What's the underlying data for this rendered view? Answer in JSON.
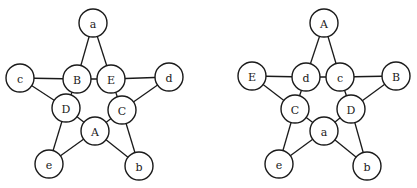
{
  "node_radius": 14,
  "colors": {
    "stroke": "#1a1a1a",
    "fill": "#ffffff"
  },
  "diagrams": [
    {
      "id": "left-pentagram",
      "nodes": [
        {
          "id": "a",
          "label": "a",
          "x": 93,
          "y": 23
        },
        {
          "id": "B",
          "label": "B",
          "x": 77,
          "y": 79
        },
        {
          "id": "E",
          "label": "E",
          "x": 111,
          "y": 79
        },
        {
          "id": "c",
          "label": "c",
          "x": 20,
          "y": 78
        },
        {
          "id": "d",
          "label": "d",
          "x": 169,
          "y": 77
        },
        {
          "id": "D",
          "label": "D",
          "x": 66,
          "y": 108
        },
        {
          "id": "C",
          "label": "C",
          "x": 122,
          "y": 110
        },
        {
          "id": "A",
          "label": "A",
          "x": 95,
          "y": 131
        },
        {
          "id": "e",
          "label": "e",
          "x": 49,
          "y": 164
        },
        {
          "id": "b",
          "label": "b",
          "x": 139,
          "y": 166
        }
      ],
      "edges": [
        [
          "a",
          "B"
        ],
        [
          "a",
          "E"
        ],
        [
          "c",
          "B"
        ],
        [
          "B",
          "E"
        ],
        [
          "E",
          "d"
        ],
        [
          "c",
          "D"
        ],
        [
          "B",
          "D"
        ],
        [
          "d",
          "C"
        ],
        [
          "E",
          "C"
        ],
        [
          "D",
          "A"
        ],
        [
          "C",
          "A"
        ],
        [
          "D",
          "e"
        ],
        [
          "A",
          "e"
        ],
        [
          "C",
          "b"
        ],
        [
          "A",
          "b"
        ]
      ]
    },
    {
      "id": "right-pentagram",
      "nodes": [
        {
          "id": "A",
          "label": "A",
          "x": 324,
          "y": 23
        },
        {
          "id": "d",
          "label": "d",
          "x": 306,
          "y": 77
        },
        {
          "id": "c",
          "label": "c",
          "x": 340,
          "y": 77
        },
        {
          "id": "E",
          "label": "E",
          "x": 252,
          "y": 76
        },
        {
          "id": "B",
          "label": "B",
          "x": 396,
          "y": 76
        },
        {
          "id": "C",
          "label": "C",
          "x": 295,
          "y": 109
        },
        {
          "id": "D",
          "label": "D",
          "x": 351,
          "y": 109
        },
        {
          "id": "a",
          "label": "a",
          "x": 324,
          "y": 131
        },
        {
          "id": "e",
          "label": "e",
          "x": 279,
          "y": 164
        },
        {
          "id": "b",
          "label": "b",
          "x": 367,
          "y": 166
        }
      ],
      "edges": [
        [
          "A",
          "d"
        ],
        [
          "A",
          "c"
        ],
        [
          "E",
          "d"
        ],
        [
          "d",
          "c"
        ],
        [
          "c",
          "B"
        ],
        [
          "E",
          "C"
        ],
        [
          "d",
          "C"
        ],
        [
          "B",
          "D"
        ],
        [
          "c",
          "D"
        ],
        [
          "C",
          "a"
        ],
        [
          "D",
          "a"
        ],
        [
          "C",
          "e"
        ],
        [
          "a",
          "e"
        ],
        [
          "D",
          "b"
        ],
        [
          "a",
          "b"
        ]
      ]
    }
  ]
}
